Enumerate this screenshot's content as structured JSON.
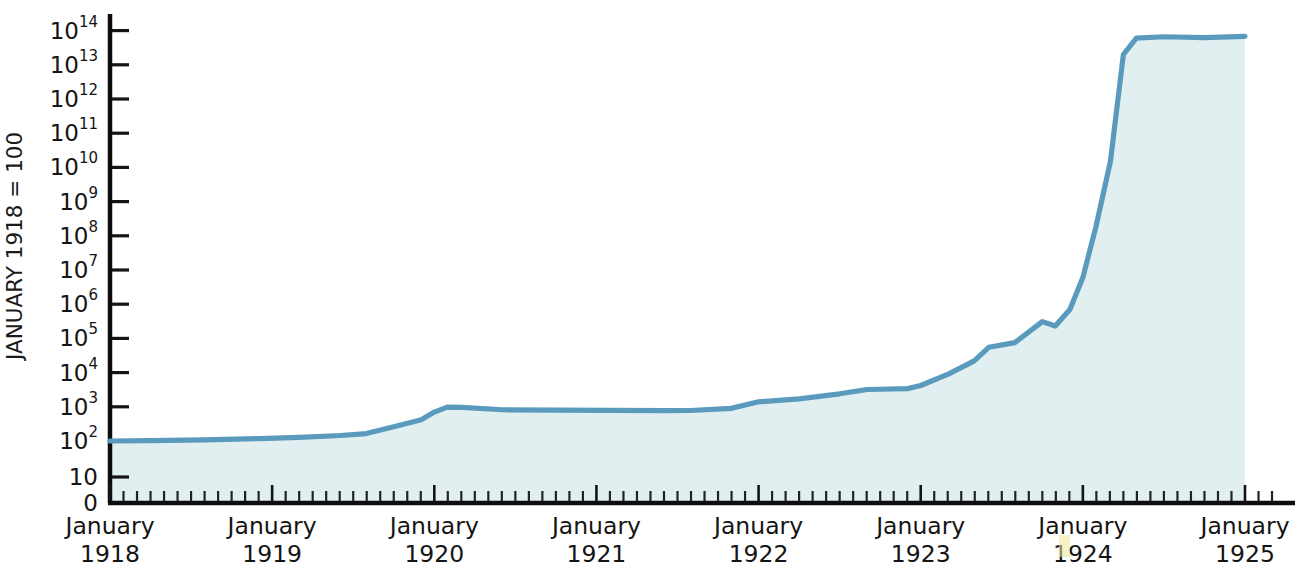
{
  "chart_data": {
    "type": "area",
    "title": "",
    "subtitle": "",
    "xlabel": "",
    "ylabel": "JANUARY 1918 = 100",
    "y_scale": "log",
    "ylim": [
      100,
      100000000000000
    ],
    "y_tick_labels": [
      "0",
      "10",
      "10²",
      "10³",
      "10⁴",
      "10⁵",
      "10⁶",
      "10⁷",
      "10⁸",
      "10⁹",
      "10¹⁰",
      "10¹¹",
      "10¹²",
      "10¹³",
      "10¹⁴"
    ],
    "y_ticks": [
      {
        "base": "0",
        "exp": "",
        "value": 0
      },
      {
        "base": "10",
        "exp": "",
        "value": 10
      },
      {
        "base": "10",
        "exp": "2",
        "value": 100
      },
      {
        "base": "10",
        "exp": "3",
        "value": 1000
      },
      {
        "base": "10",
        "exp": "4",
        "value": 10000
      },
      {
        "base": "10",
        "exp": "5",
        "value": 100000
      },
      {
        "base": "10",
        "exp": "6",
        "value": 1000000
      },
      {
        "base": "10",
        "exp": "7",
        "value": 10000000
      },
      {
        "base": "10",
        "exp": "8",
        "value": 100000000
      },
      {
        "base": "10",
        "exp": "9",
        "value": 1000000000
      },
      {
        "base": "10",
        "exp": "10",
        "value": 10000000000
      },
      {
        "base": "10",
        "exp": "11",
        "value": 100000000000
      },
      {
        "base": "10",
        "exp": "12",
        "value": 1000000000000
      },
      {
        "base": "10",
        "exp": "13",
        "value": 10000000000000
      },
      {
        "base": "10",
        "exp": "14",
        "value": 100000000000000
      }
    ],
    "x_tick_labels": [
      {
        "line1": "January",
        "line2": "1918"
      },
      {
        "line1": "January",
        "line2": "1919"
      },
      {
        "line1": "January",
        "line2": "1920"
      },
      {
        "line1": "January",
        "line2": "1921"
      },
      {
        "line1": "January",
        "line2": "1922"
      },
      {
        "line1": "January",
        "line2": "1923"
      },
      {
        "line1": "January",
        "line2": "1924"
      },
      {
        "line1": "January",
        "line2": "1925"
      }
    ],
    "x_minor_ticks_per_year": 12,
    "xlim": [
      "January 1918",
      "January 1925"
    ],
    "grid": false,
    "legend": "none",
    "series": [
      {
        "name": "German price index",
        "line_color": "#5a9bbd",
        "fill_color": "#e2eff0",
        "points": [
          {
            "x": 0.0,
            "y": 100
          },
          {
            "x": 0.25,
            "y": 102
          },
          {
            "x": 0.58,
            "y": 108
          },
          {
            "x": 0.92,
            "y": 118
          },
          {
            "x": 1.17,
            "y": 128
          },
          {
            "x": 1.42,
            "y": 145
          },
          {
            "x": 1.58,
            "y": 165
          },
          {
            "x": 1.75,
            "y": 260
          },
          {
            "x": 1.92,
            "y": 420
          },
          {
            "x": 2.0,
            "y": 700
          },
          {
            "x": 2.08,
            "y": 980
          },
          {
            "x": 2.17,
            "y": 960
          },
          {
            "x": 2.42,
            "y": 820
          },
          {
            "x": 2.75,
            "y": 800
          },
          {
            "x": 3.08,
            "y": 790
          },
          {
            "x": 3.42,
            "y": 770
          },
          {
            "x": 3.58,
            "y": 780
          },
          {
            "x": 3.83,
            "y": 900
          },
          {
            "x": 4.0,
            "y": 1400
          },
          {
            "x": 4.25,
            "y": 1700
          },
          {
            "x": 4.5,
            "y": 2400
          },
          {
            "x": 4.67,
            "y": 3200
          },
          {
            "x": 4.92,
            "y": 3400
          },
          {
            "x": 5.0,
            "y": 4200
          },
          {
            "x": 5.17,
            "y": 9000
          },
          {
            "x": 5.33,
            "y": 22000
          },
          {
            "x": 5.42,
            "y": 55000
          },
          {
            "x": 5.58,
            "y": 75000
          },
          {
            "x": 5.75,
            "y": 310000
          },
          {
            "x": 5.83,
            "y": 230000
          },
          {
            "x": 5.92,
            "y": 700000
          },
          {
            "x": 6.0,
            "y": 6000000
          },
          {
            "x": 6.08,
            "y": 180000000
          },
          {
            "x": 6.17,
            "y": 15000000000
          },
          {
            "x": 6.25,
            "y": 20000000000000
          },
          {
            "x": 6.33,
            "y": 60000000000000
          },
          {
            "x": 6.5,
            "y": 66000000000000
          },
          {
            "x": 6.75,
            "y": 62000000000000
          },
          {
            "x": 7.0,
            "y": 68000000000000
          }
        ]
      }
    ]
  },
  "colors": {
    "line": "#5a9bbd",
    "fill": "#e2eff0",
    "axis": "#0d0d0d",
    "text": "#141414"
  }
}
